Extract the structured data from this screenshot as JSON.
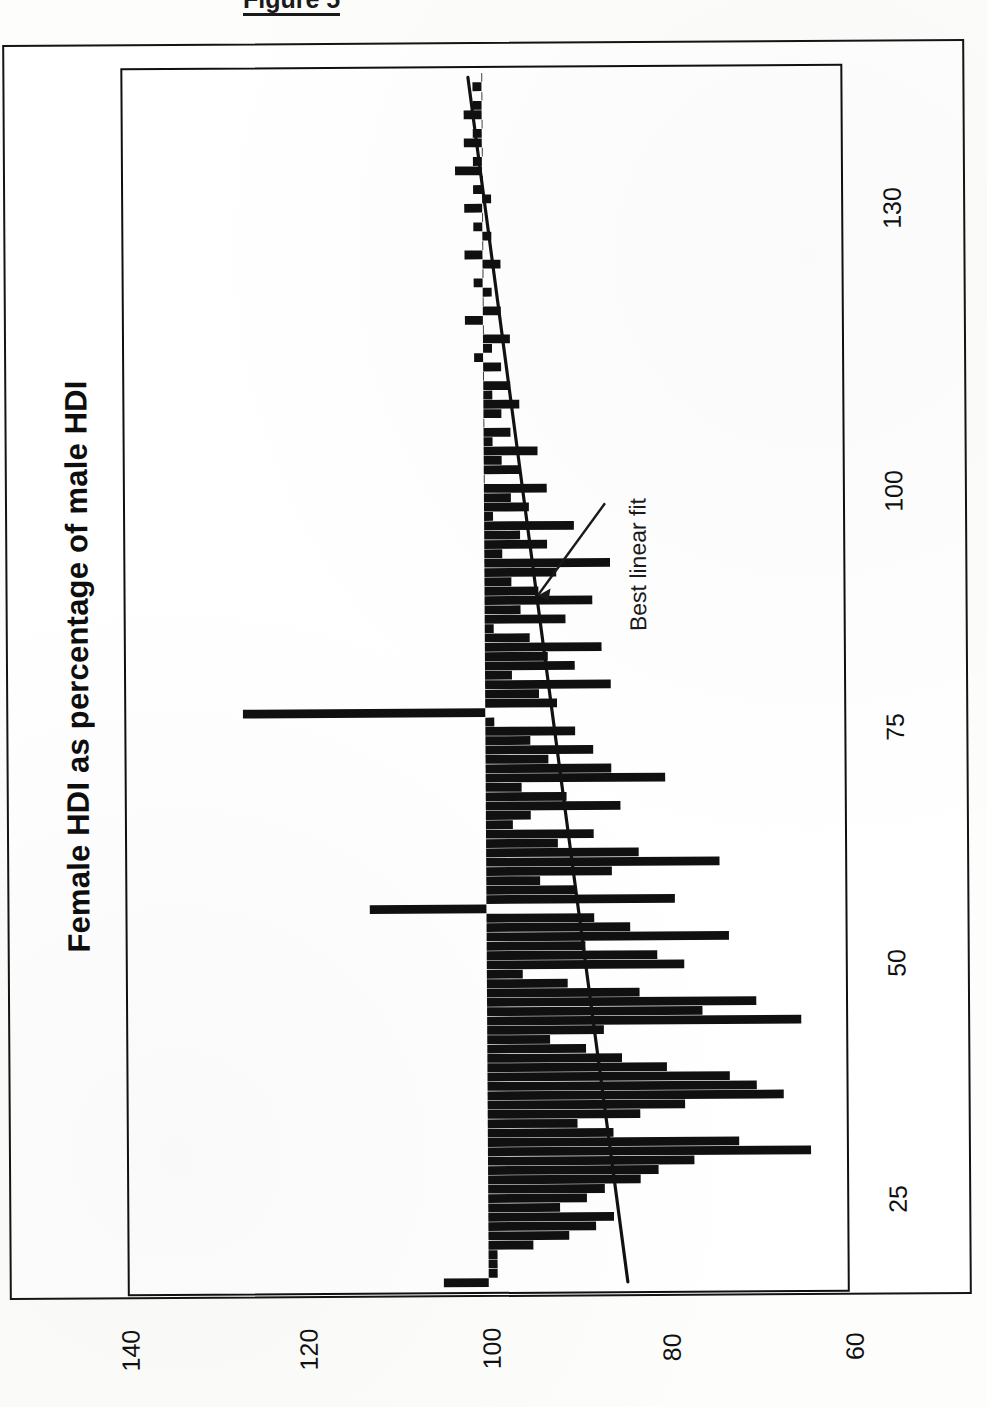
{
  "figure": {
    "caption": "Figure 5"
  },
  "chart_data": {
    "type": "bar",
    "orientation": "rotated-90-clockwise",
    "title": "Female HDI as percentage of male HDI",
    "subtitle": "",
    "xlabel": "130 countries ranked by national HDI",
    "ylabel": "Female HDI as percentage of male HDI",
    "xticks": [
      "25",
      "50",
      "75",
      "100",
      "130"
    ],
    "xtick_values": [
      25,
      50,
      75,
      100,
      130
    ],
    "yticks": [
      "140",
      "120",
      "100",
      "80",
      "60"
    ],
    "ytick_values": [
      140,
      120,
      100,
      80,
      60
    ],
    "xlim": [
      0,
      131
    ],
    "ylim": [
      60,
      140
    ],
    "baseline": 100,
    "grid": false,
    "legend": false,
    "annotations": [
      {
        "text": "Best linear fit",
        "points_to": "regression-line",
        "x": 72,
        "y": 96
      }
    ],
    "series": [
      {
        "name": "Female HDI as percentage of male HDI",
        "color": "#101010",
        "categories_label": "Country rank by national HDI (1-130)",
        "x": [
          1,
          2,
          3,
          4,
          5,
          6,
          7,
          8,
          9,
          10,
          11,
          12,
          13,
          14,
          15,
          16,
          17,
          18,
          19,
          20,
          21,
          22,
          23,
          24,
          25,
          26,
          27,
          28,
          29,
          30,
          31,
          32,
          33,
          34,
          35,
          36,
          37,
          38,
          39,
          40,
          41,
          42,
          43,
          44,
          45,
          46,
          47,
          48,
          49,
          50,
          51,
          52,
          53,
          54,
          55,
          56,
          57,
          58,
          59,
          60,
          61,
          62,
          63,
          64,
          65,
          66,
          67,
          68,
          69,
          70,
          71,
          72,
          73,
          74,
          75,
          76,
          77,
          78,
          79,
          80,
          81,
          82,
          83,
          84,
          85,
          86,
          87,
          88,
          89,
          90,
          91,
          92,
          93,
          94,
          95,
          96,
          97,
          98,
          99,
          100,
          101,
          102,
          103,
          104,
          105,
          106,
          107,
          108,
          109,
          110,
          111,
          112,
          113,
          114,
          115,
          116,
          117,
          118,
          119,
          120,
          121,
          122,
          123,
          124,
          125,
          126,
          127,
          128,
          129,
          130
        ],
        "values": [
          105,
          99,
          99,
          99,
          95,
          91,
          88,
          86,
          92,
          89,
          87,
          83,
          81,
          77,
          64,
          72,
          86,
          90,
          83,
          78,
          67,
          70,
          73,
          80,
          85,
          89,
          93,
          87,
          65,
          76,
          70,
          83,
          91,
          96,
          78,
          81,
          89,
          73,
          84,
          88,
          113,
          79,
          90,
          94,
          86,
          74,
          83,
          92,
          88,
          97,
          95,
          85,
          91,
          96,
          80,
          86,
          93,
          88,
          95,
          90,
          99,
          127,
          92,
          94,
          86,
          97,
          90,
          93,
          87,
          95,
          99,
          91,
          96,
          88,
          94,
          97,
          92,
          86,
          98,
          93,
          96,
          90,
          99,
          95,
          97,
          93,
          100,
          96,
          98,
          94,
          99,
          97,
          100,
          98,
          96,
          99,
          97,
          100,
          98,
          101,
          99,
          97,
          100,
          102,
          98,
          100,
          99,
          101,
          100,
          98,
          102,
          100,
          99,
          101,
          100,
          102,
          99,
          101,
          100,
          103,
          101,
          100,
          102,
          101,
          100,
          102,
          101,
          100,
          101,
          100
        ],
        "bar_direction": "from baseline 100"
      },
      {
        "name": "Best linear fit",
        "type": "line",
        "color": "#101010",
        "x": [
          1,
          130
        ],
        "values": [
          84.5,
          101.5
        ]
      }
    ]
  },
  "axes": {
    "x_tick_labels": [
      "25",
      "50",
      "75",
      "100",
      "130"
    ],
    "y_tick_labels": [
      "140",
      "120",
      "100",
      "80",
      "60"
    ]
  }
}
